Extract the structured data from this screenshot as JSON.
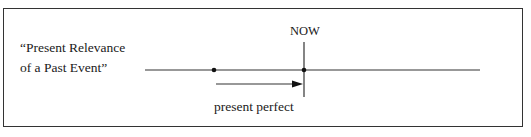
{
  "diagram": {
    "title_lines": [
      "“Present Relevance",
      "of a Past Event”"
    ],
    "now_label": "NOW",
    "arrow_label": "present perfect",
    "timeline": {
      "points": [
        {
          "name": "past-event",
          "marker": "dot"
        },
        {
          "name": "now",
          "marker": "dot-with-vertical-line"
        }
      ],
      "arrow": {
        "from": "past-event",
        "to": "now"
      }
    },
    "colors": {
      "line": "#333333",
      "text": "#1a1a1a",
      "background": "#ffffff"
    }
  }
}
